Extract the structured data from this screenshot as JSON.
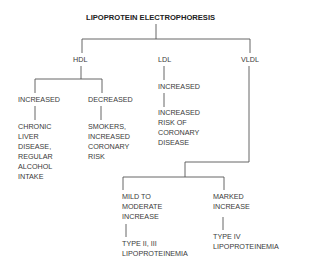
{
  "diagram": {
    "title": "LIPOPROTEIN ELECTROPHORESIS",
    "branches": {
      "hdl": {
        "label": "HDL",
        "increased": {
          "label": "INCREASED",
          "result": "CHRONIC\nLIVER\nDISEASE,\nREGULAR\nALCOHOL\nINTAKE"
        },
        "decreased": {
          "label": "DECREASED",
          "result": "SMOKERS,\nINCREASED\nCORONARY\nRISK"
        }
      },
      "ldl": {
        "label": "LDL",
        "increased": {
          "label": "INCREASED",
          "result": "INCREASED\nRISK OF\nCORONARY\nDISEASE"
        }
      },
      "vldl": {
        "label": "VLDL",
        "mild": {
          "label": "MILD TO\nMODERATE\nINCREASE",
          "result": "TYPE II, III\nLIPOPROTEINEMIA"
        },
        "marked": {
          "label": "MARKED\nINCREASE",
          "result": "TYPE IV\nLIPOPROTEINEMIA"
        }
      }
    }
  }
}
